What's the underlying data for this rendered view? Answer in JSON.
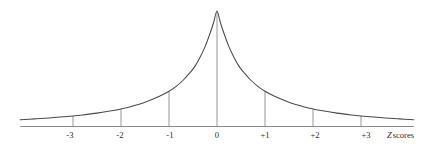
{
  "figure": {
    "width": 429,
    "height": 147,
    "background_color": "#ffffff",
    "curve_color": "#4a4a4a",
    "axis_color": "#8a8a8a",
    "dropline_color": "#8a8a8a",
    "text_color": "#2b2b2b",
    "axis_title": "Z scores",
    "axis_title_symbol": "Z",
    "axis_title_rest": "scores"
  },
  "chart_data": {
    "type": "line",
    "title": "",
    "subtitle": "",
    "xlabel": "Z scores",
    "ylabel": "",
    "grid": false,
    "legend": null,
    "xlim": [
      -4.1,
      4.1
    ],
    "ylim": [
      0,
      1
    ],
    "tick_labels": [
      "-3",
      "-2",
      "-1",
      "0",
      "+1",
      "+2",
      "+3"
    ],
    "tick_values": [
      -3,
      -2,
      -1,
      0,
      1,
      2,
      3
    ],
    "droplines_at": [
      -3,
      -2,
      -1,
      0,
      1,
      2,
      3
    ],
    "annotation": "leptokurtic distribution: sharp peak, heavy tails",
    "series": [
      {
        "name": "Leptokurtic density",
        "x": [
          -4.1,
          -3.8,
          -3.5,
          -3.2,
          -3.0,
          -2.8,
          -2.5,
          -2.2,
          -2.0,
          -1.8,
          -1.5,
          -1.2,
          -1.0,
          -0.85,
          -0.7,
          -0.55,
          -0.45,
          -0.35,
          -0.25,
          -0.15,
          -0.07,
          0,
          0.07,
          0.15,
          0.25,
          0.35,
          0.45,
          0.55,
          0.7,
          0.85,
          1.0,
          1.2,
          1.5,
          1.8,
          2.0,
          2.2,
          2.5,
          2.8,
          3.0,
          3.2,
          3.5,
          3.8,
          4.1
        ],
        "y": [
          0.055,
          0.062,
          0.07,
          0.08,
          0.087,
          0.096,
          0.112,
          0.132,
          0.148,
          0.168,
          0.206,
          0.258,
          0.302,
          0.345,
          0.4,
          0.47,
          0.525,
          0.6,
          0.688,
          0.8,
          0.9,
          1.0,
          0.9,
          0.8,
          0.688,
          0.6,
          0.525,
          0.47,
          0.4,
          0.345,
          0.302,
          0.258,
          0.206,
          0.168,
          0.148,
          0.132,
          0.112,
          0.096,
          0.087,
          0.08,
          0.07,
          0.062,
          0.055
        ]
      }
    ],
    "dropline_heights": {
      "-3": 0.087,
      "-2": 0.148,
      "-1": 0.302,
      "0": 1.0,
      "+1": 0.302,
      "+2": 0.148,
      "+3": 0.087
    }
  },
  "ticks": [
    {
      "label": "-3",
      "x": 70,
      "value": -3
    },
    {
      "label": "-2",
      "x": 120,
      "value": -2
    },
    {
      "label": "-1",
      "x": 170,
      "value": -1
    },
    {
      "label": "0",
      "x": 217,
      "value": 0
    },
    {
      "label": "+1",
      "x": 265,
      "value": 1
    },
    {
      "label": "+2",
      "x": 315,
      "value": 2
    },
    {
      "label": "+3",
      "x": 366,
      "value": 3
    }
  ]
}
